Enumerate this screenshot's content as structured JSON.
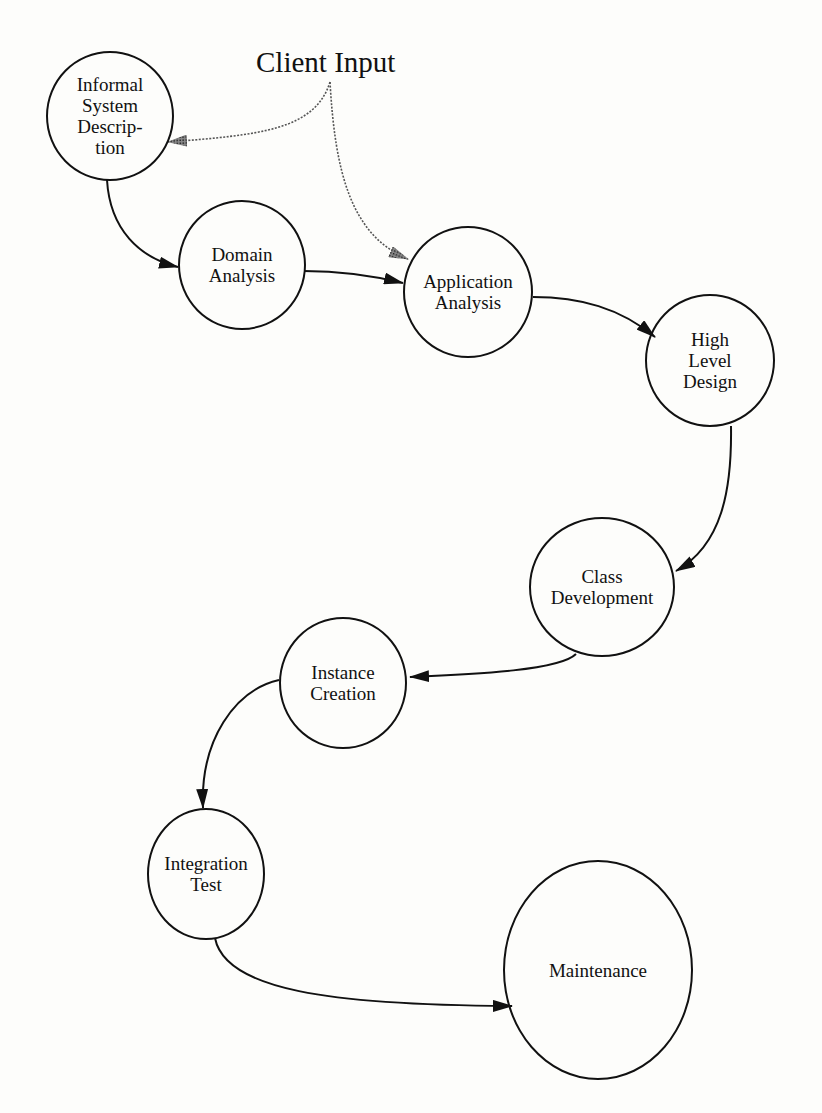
{
  "diagram": {
    "source_label": "Client Input",
    "nodes": [
      {
        "id": "informal",
        "label": "Informal\nSystem\nDescrip-\ntion"
      },
      {
        "id": "domain",
        "label": "Domain\nAnalysis"
      },
      {
        "id": "application",
        "label": "Application\nAnalysis"
      },
      {
        "id": "highlevel",
        "label": "High\nLevel\nDesign"
      },
      {
        "id": "class",
        "label": "Class\nDevelopment"
      },
      {
        "id": "instance",
        "label": "Instance\nCreation"
      },
      {
        "id": "integration",
        "label": "Integration\nTest"
      },
      {
        "id": "maintenance",
        "label": "Maintenance"
      }
    ],
    "edges": [
      {
        "from": "Client Input",
        "to": "Informal System Description",
        "style": "dotted"
      },
      {
        "from": "Client Input",
        "to": "Application Analysis",
        "style": "dotted"
      },
      {
        "from": "Informal System Description",
        "to": "Domain Analysis",
        "style": "solid"
      },
      {
        "from": "Domain Analysis",
        "to": "Application Analysis",
        "style": "solid"
      },
      {
        "from": "Application Analysis",
        "to": "High Level Design",
        "style": "solid"
      },
      {
        "from": "High Level Design",
        "to": "Class Development",
        "style": "solid"
      },
      {
        "from": "Class Development",
        "to": "Instance Creation",
        "style": "solid"
      },
      {
        "from": "Instance Creation",
        "to": "Integration Test",
        "style": "solid"
      },
      {
        "from": "Integration Test",
        "to": "Maintenance",
        "style": "solid"
      }
    ]
  }
}
